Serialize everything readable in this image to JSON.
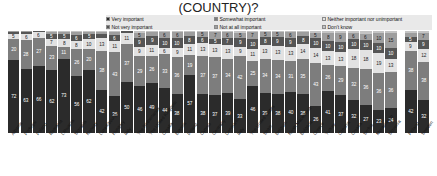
{
  "chart_title": "(COUNTRY)?",
  "colors": {
    "very_important": "#2b2b2b",
    "somewhat_important": "#7d7d7d",
    "neither": "#e2e2e2",
    "not_very_important": "#555555",
    "not_at_all_important": "#9e9e9e",
    "dont_know": "#c4c4c4",
    "legend_background": "#e9e9e9",
    "plot_background": "#ffffff"
  },
  "legend": {
    "items": [
      {
        "label": "Very important",
        "color": "#2b2b2b"
      },
      {
        "label": "Somewhat important",
        "color": "#7d7d7d"
      },
      {
        "label": "Neither important nor unimportant",
        "color": "#e2e2e2"
      },
      {
        "label": "Not very important",
        "color": "#555555"
      },
      {
        "label": "Not at all important",
        "color": "#9e9e9e"
      },
      {
        "label": "Don't know",
        "color": "#c4c4c4"
      }
    ]
  },
  "chart_data": {
    "type": "bar",
    "subtype": "stacked-100-percent",
    "title": "(COUNTRY)?",
    "xlabel": "",
    "ylabel": "",
    "ylim": [
      0,
      100
    ],
    "grid": false,
    "legend_position": "top",
    "orientation": "vertical",
    "categories": [
      "Albania",
      "Portugal",
      "Poland",
      "Romania",
      "Lithuania",
      "Slovakia",
      "Norway",
      "Luxembourg",
      "Hungary",
      "Italy",
      "The Netherlands",
      "The United Kingdom",
      "Croatia",
      "Estonia",
      "Ireland",
      "Cyprus",
      "Germany",
      "Denmark",
      "Italy",
      "The United States",
      "Spain",
      "Belgium",
      "North Macedonia",
      "Bulgaria",
      "Greece",
      "Turkey",
      "Czechia",
      "Croatia",
      "Serbia",
      "Montenegro",
      "Slovenia",
      "Finland",
      "Sweden"
    ],
    "series": [
      {
        "name": "Very important",
        "color": "#2b2b2b",
        "values": [
          72,
          63,
          66,
          62,
          73,
          56,
          62,
          42,
          36,
          50,
          46,
          49,
          44,
          38,
          57,
          38,
          37,
          39,
          33,
          46,
          39,
          38,
          40,
          38,
          26,
          41,
          37,
          32,
          27,
          23,
          24,
          42,
          32
        ]
      },
      {
        "name": "Somewhat important",
        "color": "#7d7d7d",
        "values": [
          20,
          28,
          27,
          23,
          11,
          26,
          20,
          38,
          43,
          37,
          29,
          26,
          33,
          36,
          19,
          37,
          37,
          34,
          42,
          25,
          34,
          34,
          31,
          35,
          43,
          26,
          29,
          32,
          36,
          36,
          36,
          38,
          38
        ]
      },
      {
        "name": "Neither important nor unimportant",
        "color": "#e2e2e2",
        "values": [
          5,
          6,
          6,
          7,
          8,
          8,
          10,
          13,
          11,
          11,
          9,
          11,
          6,
          9,
          11,
          13,
          13,
          13,
          9,
          11,
          13,
          13,
          13,
          14,
          14,
          13,
          13,
          18,
          18,
          19,
          13,
          9,
          12
        ]
      },
      {
        "name": "Not very important",
        "color": "#555555",
        "values": [
          2,
          2,
          1,
          5,
          5,
          6,
          5,
          4,
          6,
          2,
          9,
          9,
          10,
          10,
          8,
          6,
          5,
          7,
          9,
          10,
          8,
          9,
          9,
          8,
          10,
          10,
          10,
          10,
          10,
          10,
          10,
          5,
          9
        ]
      },
      {
        "name": "Not at all important",
        "color": "#9e9e9e",
        "values": [
          1,
          1,
          0,
          2,
          2,
          3,
          2,
          2,
          3,
          0,
          5,
          4,
          6,
          6,
          4,
          5,
          7,
          6,
          5,
          7,
          5,
          5,
          6,
          4,
          5,
          8,
          9,
          6,
          6,
          10,
          15,
          4,
          7
        ]
      },
      {
        "name": "Don't know",
        "color": "#c4c4c4",
        "values": [
          0,
          0,
          0,
          1,
          1,
          1,
          1,
          1,
          1,
          0,
          2,
          1,
          1,
          1,
          1,
          1,
          1,
          1,
          2,
          1,
          1,
          1,
          1,
          1,
          2,
          2,
          2,
          2,
          3,
          2,
          2,
          2,
          2
        ]
      }
    ],
    "visible_labels": {
      "very_important": [
        "72",
        "63",
        "66",
        "62",
        "73",
        "56",
        "62",
        "42",
        "36",
        "50",
        "46",
        "49",
        "44",
        "38",
        "57",
        "38",
        "37",
        "39",
        "33",
        "46",
        "39",
        "38",
        "40",
        "38",
        "26",
        "41",
        "37",
        "32",
        "27",
        "23",
        "24",
        "42",
        "32"
      ],
      "somewhat_important": [
        "20",
        "28",
        "27",
        "23",
        "11",
        "26",
        "20",
        "38",
        "43",
        "37",
        "29",
        "26",
        "33",
        "36",
        "19",
        "37",
        "37",
        "34",
        "42",
        "25",
        "34",
        "34",
        "31",
        "35",
        "43",
        "26",
        "29",
        "32",
        "36",
        "36",
        "36",
        "38",
        "38"
      ],
      "neither": [
        "5",
        "6",
        "6",
        "7",
        "8",
        "8",
        "10",
        "13",
        "11",
        "11",
        "9",
        "11",
        "6",
        "9",
        "11",
        "13",
        "13",
        "13",
        "9",
        "11",
        "13",
        "13",
        "13",
        "14",
        "14",
        "13",
        "13",
        "18",
        "18",
        "19",
        "13",
        "9",
        "12"
      ]
    }
  }
}
